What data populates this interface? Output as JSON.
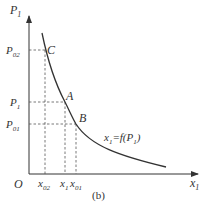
{
  "figure": {
    "caption": "(b)",
    "axes": {
      "y_label": "P",
      "y_label_sub": "1",
      "x_label": "x",
      "x_label_sub": "1",
      "origin": "O"
    },
    "y_ticks": [
      {
        "main": "P",
        "sub": "02"
      },
      {
        "main": "P",
        "sub": "1"
      },
      {
        "main": "P",
        "sub": "01"
      }
    ],
    "x_ticks": [
      {
        "main": "x",
        "sub": "02"
      },
      {
        "main": "x",
        "sub": "1"
      },
      {
        "main": "x",
        "sub": "01"
      }
    ],
    "points": [
      {
        "label": "C"
      },
      {
        "label": "A"
      },
      {
        "label": "B"
      }
    ],
    "curve_label": {
      "lhs": "x",
      "lhs_sub": "1",
      "eq": "=f(P",
      "arg_sub": "1",
      "close": ")"
    },
    "colors": {
      "line": "#333333",
      "dashed": "#555555"
    }
  }
}
